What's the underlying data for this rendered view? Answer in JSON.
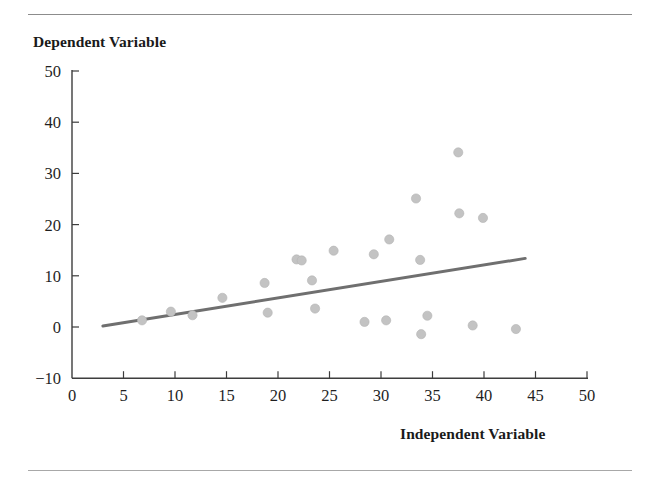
{
  "figure": {
    "title_y": "Dependent Variable",
    "title_x": "Independent Variable",
    "has_top_rule": true,
    "has_bottom_rule": true
  },
  "colors": {
    "point_fill": "#c3c3c3",
    "point_stroke": "#b4b4b4",
    "trend_line": "#6f6f6f",
    "axis": "#3d3d3d",
    "rule": "#9a9a9a",
    "background": "#ffffff"
  },
  "chart_data": {
    "type": "scatter",
    "title": "",
    "xlabel": "Independent Variable",
    "ylabel": "Dependent Variable",
    "xlim": [
      0,
      50
    ],
    "ylim": [
      -10,
      50
    ],
    "xticks": [
      0,
      5,
      10,
      15,
      20,
      25,
      30,
      35,
      40,
      45,
      50
    ],
    "yticks": [
      -10,
      0,
      10,
      20,
      30,
      40,
      50
    ],
    "xtick_labels": [
      "0",
      "5",
      "10",
      "15",
      "20",
      "25",
      "30",
      "35",
      "40",
      "45",
      "50"
    ],
    "ytick_labels": [
      "−10",
      "0",
      "10",
      "20",
      "30",
      "40",
      "50"
    ],
    "grid": false,
    "legend": false,
    "points": [
      {
        "x": 6.8,
        "y": 1.3
      },
      {
        "x": 9.6,
        "y": 3.0
      },
      {
        "x": 11.7,
        "y": 2.3
      },
      {
        "x": 14.6,
        "y": 5.7
      },
      {
        "x": 18.7,
        "y": 8.6
      },
      {
        "x": 19.0,
        "y": 2.8
      },
      {
        "x": 21.8,
        "y": 13.2
      },
      {
        "x": 22.3,
        "y": 13.0
      },
      {
        "x": 23.3,
        "y": 9.1
      },
      {
        "x": 23.6,
        "y": 3.6
      },
      {
        "x": 25.4,
        "y": 14.9
      },
      {
        "x": 28.4,
        "y": 1.0
      },
      {
        "x": 29.3,
        "y": 14.2
      },
      {
        "x": 30.5,
        "y": 1.3
      },
      {
        "x": 30.8,
        "y": 17.1
      },
      {
        "x": 33.4,
        "y": 25.1
      },
      {
        "x": 33.8,
        "y": 13.1
      },
      {
        "x": 33.9,
        "y": -1.4
      },
      {
        "x": 34.5,
        "y": 2.2
      },
      {
        "x": 37.5,
        "y": 34.1
      },
      {
        "x": 37.6,
        "y": 22.2
      },
      {
        "x": 38.9,
        "y": 0.3
      },
      {
        "x": 39.9,
        "y": 21.3
      },
      {
        "x": 43.1,
        "y": -0.4
      }
    ],
    "trend_line": {
      "x_start": 3.0,
      "y_start": 0.2,
      "x_end": 44.0,
      "y_end": 13.4,
      "style": "solid"
    },
    "n_points": 24
  }
}
